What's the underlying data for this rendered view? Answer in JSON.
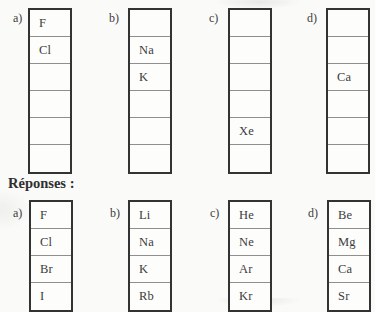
{
  "heading": "Réponses :",
  "colors": {
    "ink": "#3c3c3c",
    "box_border": "#333333",
    "cell_divider": "#8f8f8f",
    "paper": "#fafaf8"
  },
  "question_row": {
    "columns": [
      {
        "label": "a)",
        "cells": [
          "F",
          "Cl",
          "",
          "",
          "",
          ""
        ]
      },
      {
        "label": "b)",
        "cells": [
          "",
          "Na",
          "K",
          "",
          "",
          ""
        ]
      },
      {
        "label": "c)",
        "cells": [
          "",
          "",
          "",
          "",
          "Xe",
          ""
        ]
      },
      {
        "label": "d)",
        "cells": [
          "",
          "",
          "Ca",
          "",
          "",
          ""
        ]
      }
    ]
  },
  "answer_row": {
    "columns": [
      {
        "label": "a)",
        "cells": [
          "F",
          "Cl",
          "Br",
          "I"
        ]
      },
      {
        "label": "b)",
        "cells": [
          "Li",
          "Na",
          "K",
          "Rb"
        ]
      },
      {
        "label": "c)",
        "cells": [
          "He",
          "Ne",
          "Ar",
          "Kr"
        ]
      },
      {
        "label": "d)",
        "cells": [
          "Be",
          "Mg",
          "Ca",
          "Sr"
        ]
      }
    ]
  }
}
